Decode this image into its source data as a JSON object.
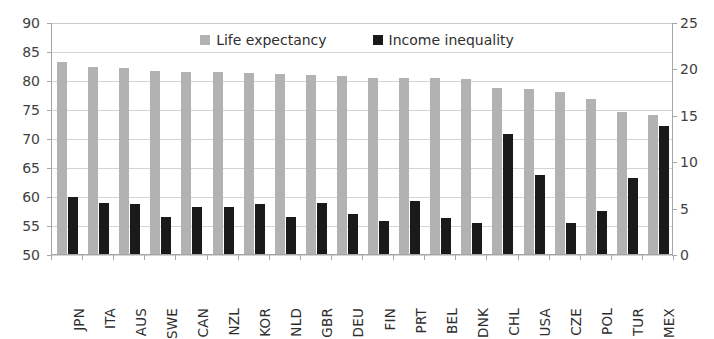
{
  "chart_data": {
    "type": "bar",
    "title": "",
    "xlabel": "",
    "categories": [
      "JPN",
      "ITA",
      "AUS",
      "SWE",
      "CAN",
      "NZL",
      "KOR",
      "NLD",
      "GBR",
      "DEU",
      "FIN",
      "PRT",
      "BEL",
      "DNK",
      "CHL",
      "USA",
      "CZE",
      "POL",
      "TUR",
      "MEX"
    ],
    "series": [
      {
        "name": "Life expectancy",
        "axis": "left",
        "color": "#b2b2b2",
        "values": [
          83.2,
          82.4,
          82.2,
          81.8,
          81.5,
          81.5,
          81.3,
          81.2,
          81.1,
          80.9,
          80.6,
          80.5,
          80.5,
          80.3,
          78.8,
          78.7,
          78.1,
          76.9,
          74.6,
          74.1
        ]
      },
      {
        "name": "Income inequality",
        "axis": "right",
        "color": "#1a1a1a",
        "values": [
          6.3,
          5.6,
          5.5,
          4.1,
          5.2,
          5.2,
          5.5,
          4.1,
          5.6,
          4.4,
          3.7,
          5.8,
          4.0,
          3.5,
          13.0,
          8.6,
          3.5,
          4.7,
          8.3,
          13.9
        ]
      }
    ],
    "left_axis": {
      "label": "",
      "ticks": [
        90,
        85,
        80,
        75,
        70,
        65,
        60,
        55,
        50
      ],
      "ylim": [
        50,
        90
      ]
    },
    "right_axis": {
      "label": "",
      "ticks": [
        25,
        20,
        15,
        10,
        5,
        0
      ],
      "ylim": [
        0,
        25
      ]
    },
    "legend": {
      "position": "top-center",
      "entries": [
        {
          "label": "Life expectancy",
          "color": "#b2b2b2"
        },
        {
          "label": "Income inequality",
          "color": "#1a1a1a"
        }
      ]
    },
    "grid": true
  }
}
